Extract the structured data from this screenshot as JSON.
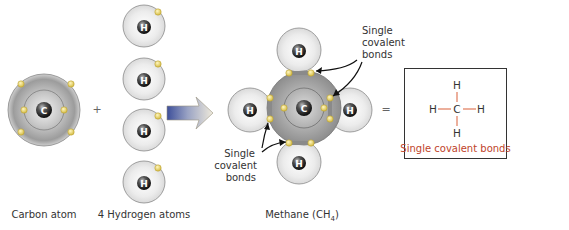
{
  "diagram": {
    "reactants": {
      "carbon": {
        "symbol": "C",
        "label": "Carbon atom",
        "outer_electrons": 4,
        "inner_electrons": 2
      },
      "plus": "+",
      "hydrogen": {
        "symbol": "H",
        "count": 4,
        "label": "4 Hydrogen atoms",
        "electrons_each": 1
      }
    },
    "product": {
      "label_main": "Methane (CH",
      "label_sub": "4",
      "label_end": ")",
      "carbon_symbol": "C",
      "hydrogen_symbol": "H",
      "annotation_top": [
        "Single",
        "covalent",
        "bonds"
      ],
      "annotation_bottom": [
        "Single",
        "covalent",
        "bonds"
      ]
    },
    "equals": "=",
    "structural_formula": {
      "center": "C",
      "top": "H",
      "bottom": "H",
      "left": "H",
      "right": "H",
      "caption": "Single covalent bonds"
    },
    "colors": {
      "electron": "#e8d46a",
      "bond_line": "#e07a5a",
      "caption": "#c0432a",
      "arrow_start": "#3d4f9a",
      "arrow_end": "#e8e3cf"
    }
  }
}
